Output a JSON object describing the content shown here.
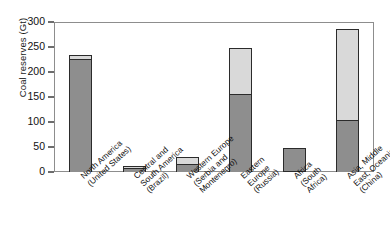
{
  "chart_data": {
    "type": "bar",
    "title": "",
    "subtitle": "",
    "xlabel": "",
    "ylabel": "Coal reserves (Gt)",
    "ylim": [
      0,
      300
    ],
    "yticks": [
      0,
      50,
      100,
      150,
      200,
      250,
      300
    ],
    "grid": false,
    "legend": "none",
    "stacked": true,
    "categories": [
      "North America (United States)",
      "Central and South America (Brazil)",
      "Western Europe (Serbia and Montenegro)",
      "Eastern Europe (Russia)",
      "Africa (South Africa)",
      "Asia, Middle East, Oceania (China)"
    ],
    "category_lines": [
      [
        "North America",
        "(United States)"
      ],
      [
        "Central and",
        "South America",
        "(Brazil)"
      ],
      [
        "Western Europe",
        "(Serbia and",
        "Montenegro)"
      ],
      [
        "Eastern",
        "Europe",
        "(Russia)"
      ],
      [
        "Africa",
        "(South",
        "Africa)"
      ],
      [
        "Asia, Middle",
        "East, Oceania",
        "(China)"
      ]
    ],
    "series": [
      {
        "name": "lower-segment",
        "color": "#8e8e8e",
        "values": [
          227,
          8,
          17,
          157,
          48,
          105
        ]
      },
      {
        "name": "upper-segment",
        "color": "#d9d9d9",
        "values": [
          9,
          7,
          15,
          94,
          0,
          183
        ]
      }
    ],
    "totals": [
      236,
      15,
      32,
      251,
      48,
      288
    ],
    "colors": {
      "lower_fill": "#8e8e8e",
      "upper_fill": "#d9d9d9",
      "bar_outline": "#2b2b2b",
      "axis": "#8d8d8d",
      "text": "#111111",
      "background": "#ffffff"
    }
  }
}
